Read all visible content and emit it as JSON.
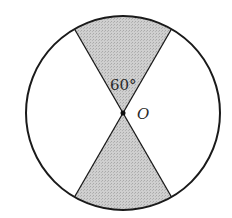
{
  "diagram": {
    "type": "circle-with-shaded-vertical-sectors",
    "center_label": "O",
    "angle_label": "60°",
    "sector_angle_degrees": 60,
    "shaded_sectors": [
      "top",
      "bottom"
    ],
    "colors": {
      "stroke": "#1a1a1a",
      "shade": "#c4c4c4",
      "background": "#ffffff"
    }
  }
}
